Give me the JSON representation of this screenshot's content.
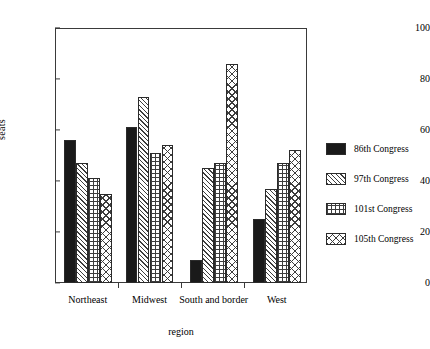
{
  "chart_data": {
    "type": "bar",
    "title": "",
    "xlabel": "region",
    "ylabel": "seats",
    "ylim": [
      0,
      100
    ],
    "yticks": [
      0,
      20,
      40,
      60,
      80,
      100
    ],
    "grid": false,
    "legend_position": "right",
    "categories": [
      "Northeast",
      "Midwest",
      "South and border",
      "West"
    ],
    "series": [
      {
        "name": "86th Congress",
        "pattern": "solid",
        "color": "#1a1a1a",
        "values": [
          56,
          61,
          9,
          25
        ]
      },
      {
        "name": "97th Congress",
        "pattern": "diagonal-hatch",
        "color": "#3d3d3d",
        "values": [
          47,
          73,
          45,
          37
        ]
      },
      {
        "name": "101st Congress",
        "pattern": "grid-hatch",
        "color": "#3d3d3d",
        "values": [
          41,
          51,
          47,
          47
        ]
      },
      {
        "name": "105th Congress",
        "pattern": "diamond-hatch",
        "color": "#3d3d3d",
        "values": [
          35,
          54,
          86,
          52
        ]
      }
    ]
  },
  "axes": {
    "y_label": "seats",
    "x_label": "region",
    "y_tick_labels": [
      "0",
      "20",
      "40",
      "60",
      "80",
      "100"
    ],
    "x_tick_labels": [
      "Northeast",
      "Midwest",
      "South and border",
      "West"
    ]
  },
  "legend": {
    "items": [
      {
        "label": "86th Congress"
      },
      {
        "label": "97th Congress"
      },
      {
        "label": "101st Congress"
      },
      {
        "label": "105th Congress"
      }
    ]
  }
}
